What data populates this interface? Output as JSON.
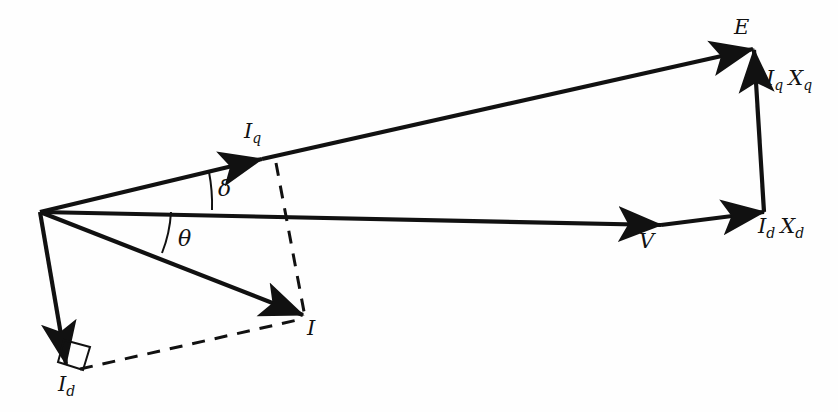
{
  "figure": {
    "type": "phasor-diagram",
    "background_color": "#fefefe",
    "stroke_color": "#111111",
    "canvas": {
      "width": 838,
      "height": 412
    }
  },
  "origin": {
    "x": 40,
    "y": 212
  },
  "labels": {
    "E": {
      "text": "E",
      "x": 734,
      "y": 17
    },
    "Iq": {
      "symbol": "I",
      "subscript": "q",
      "x": 244,
      "y": 121
    },
    "V": {
      "text": "V",
      "x": 639,
      "y": 231
    },
    "I": {
      "text": "I",
      "x": 307,
      "y": 318
    },
    "Id": {
      "symbol": "I",
      "subscript": "d",
      "x": 58,
      "y": 374
    },
    "IqXq": {
      "symbol1": "I",
      "sub1": "q",
      "symbol2": "X",
      "sub2": "q",
      "x": 766,
      "y": 68
    },
    "IdXd": {
      "symbol1": "I",
      "sub1": "d",
      "symbol2": "X",
      "sub2": "d",
      "x": 758,
      "y": 216
    },
    "delta": {
      "text": "δ",
      "x": 218,
      "y": 178
    },
    "theta": {
      "text": "θ",
      "x": 178,
      "y": 228
    }
  },
  "vectors": [
    {
      "name": "q-axis-current",
      "label": "Iq",
      "from": {
        "x": 40,
        "y": 212
      },
      "to": {
        "x": 262,
        "y": 159
      },
      "arrowhead": true,
      "style": "solid",
      "width": 4.2
    },
    {
      "name": "q-axis-extension-to-E",
      "label": "E",
      "from": {
        "x": 262,
        "y": 159
      },
      "to": {
        "x": 753,
        "y": 49
      },
      "arrowhead": true,
      "style": "solid",
      "width": 4.2
    },
    {
      "name": "terminal-voltage",
      "label": "V",
      "from": {
        "x": 40,
        "y": 212
      },
      "to": {
        "x": 661,
        "y": 225
      },
      "arrowhead": true,
      "style": "solid",
      "width": 4.2
    },
    {
      "name": "armature-current",
      "label": "I",
      "from": {
        "x": 40,
        "y": 212
      },
      "to": {
        "x": 303,
        "y": 315
      },
      "arrowhead": true,
      "style": "solid",
      "width": 4.2
    },
    {
      "name": "d-axis-current",
      "label": "Id",
      "from": {
        "x": 40,
        "y": 212
      },
      "to": {
        "x": 66,
        "y": 364
      },
      "arrowhead": true,
      "style": "solid",
      "width": 4.2
    },
    {
      "name": "d-axis-reactance-drop",
      "label": "IdXd",
      "from": {
        "x": 661,
        "y": 225
      },
      "to": {
        "x": 764,
        "y": 212
      },
      "arrowhead": true,
      "style": "solid",
      "width": 4.2
    },
    {
      "name": "q-axis-reactance-drop",
      "label": "IqXq",
      "from": {
        "x": 764,
        "y": 212
      },
      "to": {
        "x": 754,
        "y": 50
      },
      "arrowhead": true,
      "style": "solid",
      "width": 4.2
    }
  ],
  "construction_lines": [
    {
      "name": "current-projection-to-q-axis",
      "from": {
        "x": 276,
        "y": 163
      },
      "to": {
        "x": 305,
        "y": 317
      },
      "style": "dashed"
    },
    {
      "name": "current-projection-to-d-axis",
      "from": {
        "x": 80,
        "y": 369
      },
      "to": {
        "x": 302,
        "y": 319
      },
      "style": "dashed"
    }
  ],
  "angles": [
    {
      "name": "delta-load-angle",
      "label": "delta",
      "between": [
        "q-axis-current",
        "terminal-voltage"
      ],
      "arc_from": {
        "x": 209,
        "y": 172
      },
      "arc_to": {
        "x": 212,
        "y": 210
      }
    },
    {
      "name": "theta-power-factor-angle",
      "label": "theta",
      "between": [
        "terminal-voltage",
        "armature-current"
      ],
      "arc_from": {
        "x": 171,
        "y": 212
      },
      "arc_to": {
        "x": 162,
        "y": 253
      }
    }
  ],
  "right_angle_marker": {
    "name": "right-angle-at-Id",
    "points": "64,340 90,347 83,370 58,362"
  }
}
